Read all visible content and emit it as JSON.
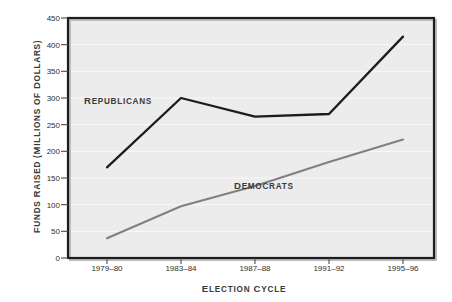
{
  "chart_data": {
    "type": "line",
    "title": "",
    "xlabel": "Election Cycle",
    "ylabel": "Funds Raised (Millions of Dollars)",
    "categories": [
      "1979–80",
      "1983–84",
      "1987–88",
      "1991–92",
      "1995–96"
    ],
    "ylim": [
      0,
      450
    ],
    "yticks": [
      0,
      50,
      100,
      150,
      200,
      250,
      300,
      350,
      400,
      450
    ],
    "ytick_labels": [
      "0",
      "50",
      "100",
      "150",
      "200",
      "250",
      "300",
      "350",
      "400",
      "450"
    ],
    "grid": true,
    "grid_axis": "y",
    "legend": "inline-annotations",
    "series": [
      {
        "name": "Republicans",
        "color": "#1c1c1c",
        "values": [
          170,
          300,
          265,
          270,
          415
        ]
      },
      {
        "name": "Democrats",
        "color": "#808080",
        "values": [
          37,
          97,
          135,
          180,
          222
        ]
      }
    ],
    "annotations": [
      {
        "text": "Republicans",
        "series": "Republicans"
      },
      {
        "text": "Democrats",
        "series": "Democrats"
      }
    ],
    "colors": {
      "plot_background": "#ececec",
      "frame": "#1c1c1c",
      "gridline": "#f7f7f7",
      "republicans": "#1c1c1c",
      "democrats": "#808080",
      "text": "#2e2e2e"
    }
  },
  "axes": {
    "x_title": "Election Cycle",
    "y_title": "Funds Raised (Millions of Dollars)"
  }
}
